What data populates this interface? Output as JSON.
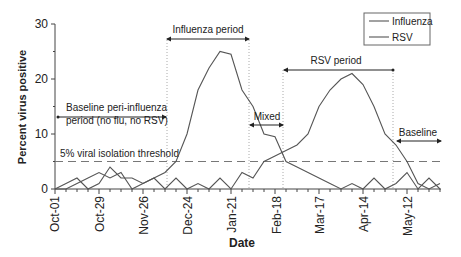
{
  "chart_data": {
    "type": "line",
    "title": "",
    "xlabel": "Date",
    "ylabel": "Percent virus positive",
    "ylim": [
      0,
      30
    ],
    "yticks": [
      0,
      10,
      20,
      30
    ],
    "xticks_labels": [
      "Oct-01",
      "Oct-29",
      "Nov-26",
      "Dec-24",
      "Jan-21",
      "Feb-18",
      "Mar-17",
      "Apr-14",
      "May-12"
    ],
    "xticks_week_index": [
      0,
      4,
      8,
      12,
      16,
      20,
      24,
      28,
      32
    ],
    "x_unit": "week",
    "x": [
      0,
      1,
      2,
      3,
      4,
      5,
      6,
      7,
      8,
      9,
      10,
      11,
      12,
      13,
      14,
      15,
      16,
      17,
      18,
      19,
      20,
      21,
      22,
      23,
      24,
      25,
      26,
      27,
      28,
      29,
      30,
      31,
      32,
      33,
      34,
      35
    ],
    "series": [
      {
        "name": "Influenza",
        "values": [
          0,
          1,
          2,
          0,
          1,
          4,
          2,
          2,
          1,
          2,
          3,
          5,
          10,
          18,
          22,
          25,
          24.5,
          18,
          15,
          10,
          9.5,
          5,
          4,
          3,
          2,
          1,
          0,
          1,
          0,
          2,
          0,
          1,
          3,
          0,
          2,
          0
        ]
      },
      {
        "name": "RSV",
        "values": [
          0,
          0,
          1,
          2,
          3,
          2,
          3,
          0,
          1,
          2,
          0,
          2,
          0,
          1,
          0,
          2,
          0,
          3,
          2,
          5,
          6,
          7,
          8,
          10,
          15,
          18,
          20,
          21,
          19,
          15,
          10,
          8,
          5,
          1,
          0,
          1
        ]
      }
    ],
    "reference_lines": [
      {
        "type": "horizontal",
        "y": 5,
        "style": "dashed",
        "label": "5% viral isolation threshold"
      }
    ],
    "annotations": [
      {
        "label": "Baseline peri-influenza period (no flu, no RSV)",
        "from_week": 0,
        "to_week": 12
      },
      {
        "label": "Influenza period",
        "from_week": 12,
        "to_week": 17.5
      },
      {
        "label": "Mixed",
        "from_week": 17.5,
        "to_week": 20.5
      },
      {
        "label": "RSV period",
        "from_week": 20.5,
        "to_week": 30
      },
      {
        "label": "Baseline",
        "from_week": 30,
        "to_week": 35
      }
    ],
    "legend": {
      "position": "top-right",
      "entries": [
        "Influenza",
        "RSV"
      ]
    },
    "grid": false
  },
  "labels": {
    "ylabel": "Percent virus positive",
    "xlabel": "Date",
    "threshold": "5% viral isolation threshold",
    "baseline_peri_line1": "Baseline peri-influenza",
    "baseline_peri_line2": "period (no flu, no RSV)",
    "influenza_period": "Influenza period",
    "mixed": "Mixed",
    "rsv_period": "RSV period",
    "baseline": "Baseline",
    "legend_influenza": "Influenza",
    "legend_rsv": "RSV",
    "y0": "0",
    "y10": "10",
    "y20": "20",
    "y30": "30",
    "x0": "Oct-01",
    "x1": "Oct-29",
    "x2": "Nov-26",
    "x3": "Dec-24",
    "x4": "Jan-21",
    "x5": "Feb-18",
    "x6": "Mar-17",
    "x7": "Apr-14",
    "x8": "May-12"
  },
  "colors": {
    "line": "#555555",
    "axis": "#444444",
    "text": "#222222",
    "dotted": "#aaaaaa"
  }
}
